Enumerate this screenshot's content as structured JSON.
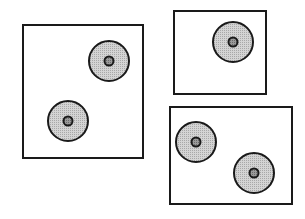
{
  "diagram": {
    "colors": {
      "background": "#ffffff",
      "stroke": "#1a1a1a",
      "disc_fill": "#c8c8c8",
      "core_fill": "#8a8a8a"
    },
    "boxes": [
      {
        "id": "box-left",
        "x": 23,
        "y": 25,
        "w": 120,
        "h": 133,
        "discs": [
          {
            "cx": 109,
            "cy": 61,
            "r": 20
          },
          {
            "cx": 68,
            "cy": 121,
            "r": 20
          }
        ]
      },
      {
        "id": "box-top-right",
        "x": 174,
        "y": 11,
        "w": 92,
        "h": 83,
        "discs": [
          {
            "cx": 233,
            "cy": 42,
            "r": 20
          }
        ]
      },
      {
        "id": "box-bottom-right",
        "x": 170,
        "y": 107,
        "w": 122,
        "h": 97,
        "discs": [
          {
            "cx": 196,
            "cy": 142,
            "r": 20
          },
          {
            "cx": 254,
            "cy": 173,
            "r": 20
          }
        ]
      }
    ]
  }
}
